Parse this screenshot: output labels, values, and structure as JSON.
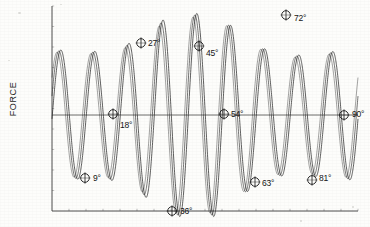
{
  "chart_data": {
    "type": "line",
    "title": "",
    "subtitle": "",
    "xlabel": "",
    "ylabel": "FORCE",
    "grid": false,
    "legend": false,
    "legend_position": "none",
    "axis": {
      "frame": "left-bottom-box",
      "x_tick_labels": [],
      "y_tick_labels": [],
      "xlim": [
        0,
        100
      ],
      "ylim": [
        -1.1,
        1.1
      ],
      "zero_line": true
    },
    "series": [
      {
        "name": "force",
        "type": "line",
        "color": "#2a2a2a",
        "cycles": 9,
        "carrier_periods": 9.0,
        "envelope": "beat",
        "points_note": "high-frequency sinusoid with slowly varying amplitude"
      }
    ],
    "annotations": [
      {
        "label": "9°",
        "x": 85,
        "y": 178,
        "tx": 93,
        "ty": 173,
        "marker": "circle-cross"
      },
      {
        "label": "18°",
        "x": 113,
        "y": 114,
        "tx": 120,
        "ty": 120,
        "marker": "circle-cross"
      },
      {
        "label": "27°",
        "x": 141,
        "y": 43,
        "tx": 148,
        "ty": 38,
        "marker": "circle-cross"
      },
      {
        "label": "36°",
        "x": 172,
        "y": 211,
        "tx": 180,
        "ty": 206,
        "marker": "circle-cross"
      },
      {
        "label": "45°",
        "x": 199,
        "y": 46,
        "tx": 206,
        "ty": 48,
        "marker": "circle-cross"
      },
      {
        "label": "54°",
        "x": 224,
        "y": 114,
        "tx": 231,
        "ty": 109,
        "marker": "circle-cross"
      },
      {
        "label": "63°",
        "x": 255,
        "y": 182,
        "tx": 262,
        "ty": 178,
        "marker": "circle-cross"
      },
      {
        "label": "72°",
        "x": 286,
        "y": 15,
        "tx": 294,
        "ty": 13,
        "marker": "circle-cross"
      },
      {
        "label": "81°",
        "x": 312,
        "y": 180,
        "tx": 319,
        "ty": 173,
        "marker": "circle-cross"
      },
      {
        "label": "90°",
        "x": 344,
        "y": 115,
        "tx": 352,
        "ty": 109,
        "marker": "circle-cross"
      }
    ],
    "colors": {
      "trace": "#2b2b2b",
      "frame": "#3a3a3a",
      "zero_line": "#4a4a4a",
      "background": "#fdfdfb",
      "text": "#141414"
    }
  },
  "figure": {
    "ylabel": "FORCE"
  }
}
